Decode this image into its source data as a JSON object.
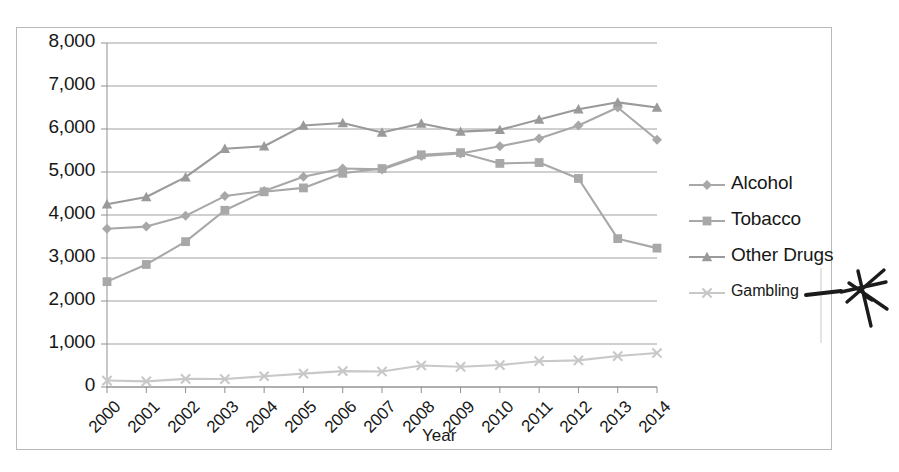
{
  "chart_data": {
    "type": "line",
    "title": "",
    "xlabel": "Year",
    "ylabel": "",
    "categories": [
      "2000",
      "2001",
      "2002",
      "2003",
      "2004",
      "2005",
      "2006",
      "2007",
      "2008",
      "2009",
      "2010",
      "2011",
      "2012",
      "2013",
      "2014"
    ],
    "x": [
      2000,
      2001,
      2002,
      2003,
      2004,
      2005,
      2006,
      2007,
      2008,
      2009,
      2010,
      2011,
      2012,
      2013,
      2014
    ],
    "ylim": [
      0,
      8000
    ],
    "ytick_labels": [
      "8,000",
      "7,000",
      "6,000",
      "5,000",
      "4,000",
      "3,000",
      "2,000",
      "1,000",
      "0"
    ],
    "ytick_values": [
      8000,
      7000,
      6000,
      5000,
      4000,
      3000,
      2000,
      1000,
      0
    ],
    "grid": true,
    "legend_position": "right",
    "series": [
      {
        "name": "Alcohol",
        "marker": "diamond",
        "color": "#a8a8a8",
        "values": [
          3680,
          3730,
          3980,
          4440,
          4560,
          4890,
          5080,
          5060,
          5370,
          5430,
          5600,
          5780,
          6080,
          6500,
          5750
        ]
      },
      {
        "name": "Tobacco",
        "marker": "square",
        "color": "#a8a8a8",
        "values": [
          2450,
          2850,
          3380,
          4110,
          4540,
          4630,
          4970,
          5080,
          5400,
          5450,
          5200,
          5220,
          4850,
          3450,
          3230
        ]
      },
      {
        "name": "Other Drugs",
        "marker": "triangle",
        "color": "#9a9a9a",
        "values": [
          4250,
          4420,
          4880,
          5540,
          5600,
          6080,
          6140,
          5920,
          6130,
          5940,
          5980,
          6220,
          6460,
          6620,
          6500
        ]
      },
      {
        "name": "Gambling",
        "marker": "cross",
        "color": "#c8c8c8",
        "values": [
          150,
          130,
          190,
          185,
          250,
          310,
          370,
          360,
          500,
          470,
          510,
          600,
          620,
          720,
          790
        ]
      }
    ]
  },
  "legend": {
    "items": [
      {
        "label": "Alcohol"
      },
      {
        "label": "Tobacco"
      },
      {
        "label": "Other Drugs"
      },
      {
        "label": "Gambling"
      }
    ]
  },
  "annotation": {
    "kind": "handwritten-mark",
    "description": "hand-drawn arrow pointing to a scribbled star/asterisk",
    "color": "#1b1b1b"
  }
}
